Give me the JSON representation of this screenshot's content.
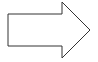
{
  "diagram": {
    "shape": "right-arrow",
    "stroke_color": "#333333",
    "fill_color": "#ffffff",
    "stroke_width": 1,
    "points": "8,14 62,14 62,2 90,30 62,58 62,46 8,46"
  }
}
